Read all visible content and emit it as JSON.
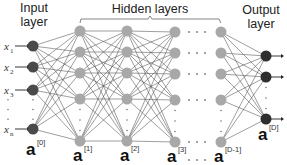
{
  "labels": {
    "input_layer_line1": "Input",
    "input_layer_line2": "layer",
    "hidden_layers": "Hidden layers",
    "output_layer_line1": "Output",
    "output_layer_line2": "layer"
  },
  "inputs": [
    {
      "base": "x",
      "sub": "1"
    },
    {
      "base": "x",
      "sub": "2"
    },
    {
      "base": "x",
      "sub": "3"
    },
    {
      "base": "x",
      "sub": "n"
    }
  ],
  "activations": [
    {
      "base": "a",
      "sup": "[0]"
    },
    {
      "base": "a",
      "sup": "[1]"
    },
    {
      "base": "a",
      "sup": "[2]"
    },
    {
      "base": "a",
      "sup": "[3]"
    },
    {
      "base": "a",
      "sup": "[D-1]"
    },
    {
      "base": "a",
      "sup": "[D]"
    }
  ],
  "colors": {
    "input_node": "#4a4a4a",
    "hidden_node": "#a8a8a8",
    "output_node": "#2e2e2e",
    "edge": "#555555"
  },
  "layers": [
    {
      "name": "input",
      "x": 33,
      "ys": [
        46,
        67,
        90,
        129
      ]
    },
    {
      "name": "hidden1",
      "x": 80,
      "ys": [
        31,
        52,
        73,
        99,
        141
      ]
    },
    {
      "name": "hidden2",
      "x": 127,
      "ys": [
        31,
        52,
        73,
        99,
        141
      ]
    },
    {
      "name": "hidden3",
      "x": 175,
      "ys": [
        32,
        53,
        74,
        100,
        142
      ]
    },
    {
      "name": "hiddenD-1",
      "x": 221,
      "ys": [
        32,
        53,
        74,
        100,
        142
      ]
    },
    {
      "name": "output",
      "x": 266,
      "ys": [
        56,
        77,
        119
      ]
    }
  ]
}
